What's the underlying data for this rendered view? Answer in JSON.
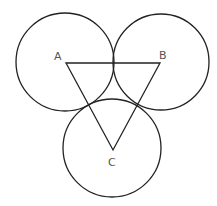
{
  "diagram": {
    "stroke_color": "#222222",
    "label_color": "#555555",
    "circles": [
      {
        "name": "A",
        "cx": 65,
        "cy": 62,
        "r": 49
      },
      {
        "name": "B",
        "cx": 161,
        "cy": 62,
        "r": 48
      },
      {
        "name": "C",
        "cx": 112,
        "cy": 148,
        "r": 49
      }
    ],
    "triangle": {
      "points": "66,63 160,63 113,150"
    },
    "labels": [
      {
        "text": "A",
        "x": 54,
        "y": 60
      },
      {
        "text": "B",
        "x": 159,
        "y": 59
      },
      {
        "text": "C",
        "x": 108,
        "y": 166
      }
    ]
  }
}
